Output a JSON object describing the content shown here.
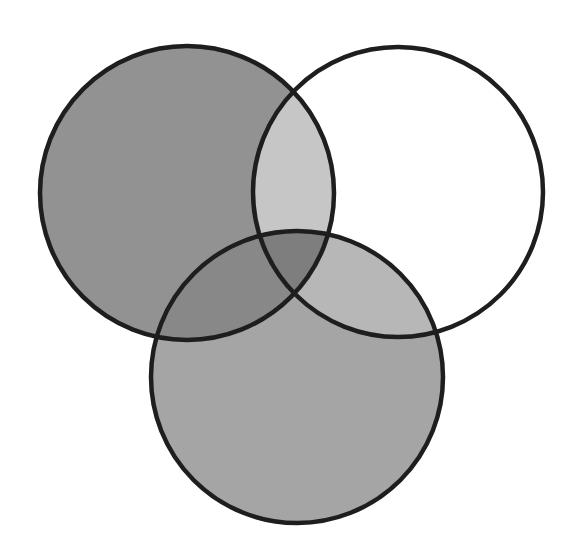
{
  "diagram": {
    "type": "venn-3",
    "canvas": {
      "width": 573,
      "height": 557,
      "background": "#ffffff"
    },
    "outline_color": "#1e1e1e",
    "circles": [
      {
        "id": "A",
        "name": "left-circle",
        "cx": 187,
        "cy": 193,
        "r": 147
      },
      {
        "id": "B",
        "name": "right-circle",
        "cx": 398,
        "cy": 192,
        "r": 145
      },
      {
        "id": "C",
        "name": "bottom-circle",
        "cx": 297,
        "cy": 377,
        "r": 146
      }
    ],
    "regions": {
      "A_only": {
        "fill": "#929292",
        "shaded": true
      },
      "B_only": {
        "fill": "#ffffff",
        "shaded": false
      },
      "C_only": {
        "fill": "#a5a5a5",
        "shaded": true
      },
      "AB_only": {
        "fill": "#c6c6c6",
        "shaded": true
      },
      "AC_only": {
        "fill": "#888888",
        "shaded": true
      },
      "BC_only": {
        "fill": "#b7b7b7",
        "shaded": true
      },
      "ABC": {
        "fill": "#7e7e7e",
        "shaded": true
      }
    }
  }
}
